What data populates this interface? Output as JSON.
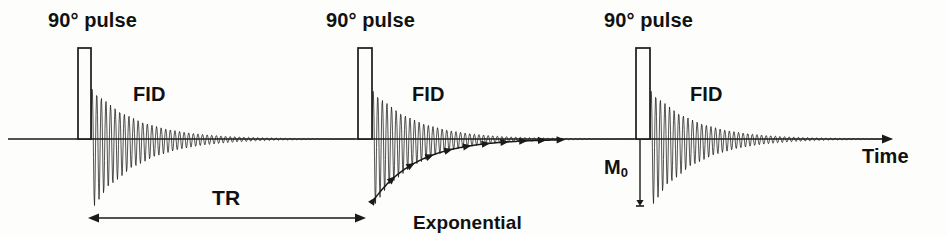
{
  "figure": {
    "background_color": "#fdfdfb",
    "ink_color": "#1a1a1a",
    "baseline_y": 139,
    "axis": {
      "label": "Time",
      "x_start": 8,
      "x_end": 893,
      "arrow": "right",
      "label_x": 862,
      "label_y": 146
    },
    "labels": {
      "pulse": "90° pulse",
      "fid": "FID",
      "tr": "TR",
      "exponential_line1": "Exponential",
      "exponential_line2": "decay",
      "m0": "M",
      "m0_sub": "0",
      "time": "Time"
    },
    "pulses": [
      {
        "name": "pulse-1",
        "x": 78,
        "width": 13,
        "top_y": 48,
        "label_x": 48,
        "label_y": 10
      },
      {
        "name": "pulse-2",
        "x": 358,
        "width": 14,
        "top_y": 48,
        "label_x": 326,
        "label_y": 10
      },
      {
        "name": "pulse-3",
        "x": 636,
        "width": 14,
        "top_y": 48,
        "label_x": 604,
        "label_y": 10
      }
    ],
    "fids": [
      {
        "name": "fid-1",
        "start_x": 91,
        "end_x": 355,
        "amp_up": 52,
        "amp_down": 72,
        "decay_constant": 46,
        "period": 4.6,
        "label_x": 133,
        "label_y": 84
      },
      {
        "name": "fid-2",
        "start_x": 372,
        "end_x": 634,
        "amp_up": 50,
        "amp_down": 70,
        "decay_constant": 44,
        "period": 4.6,
        "label_x": 412,
        "label_y": 84
      },
      {
        "name": "fid-3",
        "start_x": 650,
        "end_x": 892,
        "amp_up": 50,
        "amp_down": 70,
        "decay_constant": 44,
        "period": 4.6,
        "label_x": 690,
        "label_y": 84
      }
    ],
    "envelope": {
      "name": "exponential-decay-envelope",
      "start_x": 373,
      "end_x": 560,
      "start_depth": 62,
      "decay_constant": 44,
      "marker_count": 11,
      "label_x": 413,
      "label_y": 172
    },
    "tr_marker": {
      "name": "tr-interval",
      "x_start": 88,
      "x_end": 366,
      "y": 218,
      "label_x": 212,
      "label_y": 187
    },
    "m0_marker": {
      "name": "m0-amplitude",
      "x": 640,
      "y_top": 140,
      "y_bottom": 206,
      "label_x": 604,
      "label_y": 157
    }
  }
}
